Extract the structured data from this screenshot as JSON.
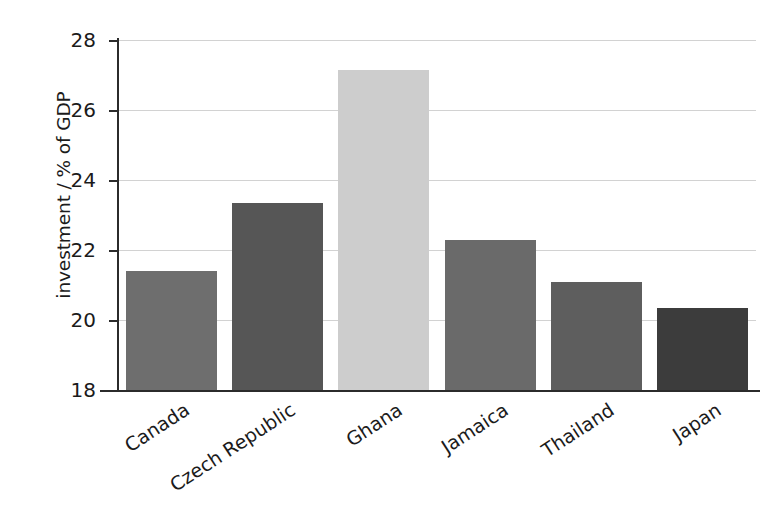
{
  "chart_data": {
    "type": "bar",
    "title": "",
    "xlabel": "",
    "ylabel": "investment / % of GDP",
    "categories": [
      "Canada",
      "Czech Republic",
      "Ghana",
      "Jamaica",
      "Thailand",
      "Japan"
    ],
    "values": [
      21.4,
      23.35,
      27.15,
      22.3,
      21.1,
      20.35
    ],
    "ylim": [
      18,
      28
    ],
    "yticks": [
      18,
      20,
      22,
      24,
      26,
      28
    ],
    "ytick_labels": [
      "18",
      "20",
      "22",
      "24",
      "26",
      "28"
    ],
    "grid": true,
    "legend": "none",
    "bar_colors": [
      "#6e6e6e",
      "#565656",
      "#cdcdcd",
      "#6a6a6a",
      "#5e5e5e",
      "#3c3c3c"
    ],
    "axis_color": "#2b2b2b",
    "grid_color": "#d2d2d2",
    "background_color": "#ffffff",
    "x_label_rotation_deg": -33
  },
  "axes": {
    "y_title": "investment / % of GDP"
  }
}
